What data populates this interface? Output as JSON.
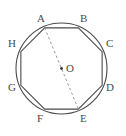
{
  "figure": {
    "kind": "geometry-diagram",
    "background_color": "#ffffff",
    "stroke_color": "#4a4a4a",
    "dash_color": "#8c8c8c",
    "label_color": "#4a4a4a",
    "width": 126,
    "height": 136
  },
  "circle": {
    "center_x": 61.5,
    "center_y": 68.5,
    "radius": 45.5,
    "stroke_width": 1.1
  },
  "octagon": {
    "sides": 8,
    "stroke_width": 1.1,
    "circumradius": 44,
    "vertices": [
      {
        "id": "A",
        "angle_deg": 112.5,
        "x": 44.66,
        "y": 27.86,
        "label": "A",
        "label_x": 37,
        "label_y": 13
      },
      {
        "id": "B",
        "angle_deg": 67.5,
        "x": 78.34,
        "y": 27.86,
        "label": "B",
        "label_x": 80,
        "label_y": 13
      },
      {
        "id": "C",
        "angle_deg": 22.5,
        "x": 102.14,
        "y": 51.66,
        "label": "C",
        "label_x": 106,
        "label_y": 38
      },
      {
        "id": "D",
        "angle_deg": -22.5,
        "x": 102.14,
        "y": 85.34,
        "label": "D",
        "label_x": 106,
        "label_y": 82
      },
      {
        "id": "E",
        "angle_deg": -67.5,
        "x": 78.34,
        "y": 109.14,
        "label": "E",
        "label_x": 80,
        "label_y": 113
      },
      {
        "id": "F",
        "angle_deg": -112.5,
        "x": 44.66,
        "y": 109.14,
        "label": "F",
        "label_x": 37,
        "label_y": 113
      },
      {
        "id": "G",
        "angle_deg": -157.5,
        "x": 20.86,
        "y": 85.34,
        "label": "G",
        "label_x": 8,
        "label_y": 82
      },
      {
        "id": "H",
        "angle_deg": 157.5,
        "x": 20.86,
        "y": 51.66,
        "label": "H",
        "label_x": 8,
        "label_y": 38
      }
    ]
  },
  "center_point": {
    "label": "O",
    "dot_x": 61.5,
    "dot_y": 68.5,
    "dot_radius": 1.4,
    "label_x": 66,
    "label_y": 63
  },
  "diagonal": {
    "from": "A",
    "to": "E",
    "style": "dashed",
    "dash_pattern": "2.5 2.5",
    "stroke_width": 0.9,
    "x1": 44.66,
    "y1": 27.86,
    "x2": 78.34,
    "y2": 109.14
  }
}
